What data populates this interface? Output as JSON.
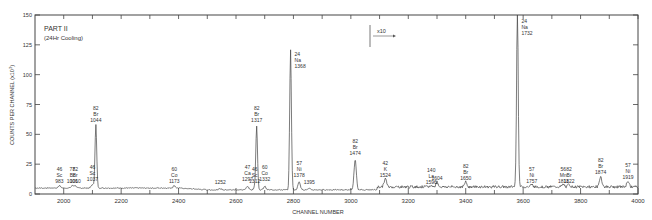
{
  "chart_data": {
    "type": "line",
    "title": "PART II",
    "subtitle": "(24Hr Cooling)",
    "xlabel": "CHANNEL NUMBER",
    "ylabel": "COUNTS PER CHANNEL (x10^3)",
    "xlim": [
      1900,
      4000
    ],
    "ylim": [
      0,
      150
    ],
    "x_ticks": [
      2000,
      2200,
      2400,
      2600,
      2800,
      3000,
      3200,
      3400,
      3600,
      3800,
      4000
    ],
    "y_ticks": [
      0,
      25,
      50,
      75,
      100,
      125,
      150
    ],
    "y_tick_labels": [
      "0",
      "25",
      "50",
      "75",
      "100",
      "125",
      "150"
    ],
    "grid": false,
    "scale_annotation": {
      "text": "x10",
      "x_start": 3290,
      "note": "data beyond this channel shown magnified x10"
    },
    "baseline_counts": 5,
    "peaks": [
      {
        "channel": 1985,
        "height": 7,
        "label": [
          "46",
          "Sc",
          "983"
        ]
      },
      {
        "channel": 2030,
        "height": 7,
        "label": [
          "77",
          "Br",
          "1006"
        ]
      },
      {
        "channel": 2040,
        "height": 7,
        "label": [
          "82",
          "Br",
          "1010"
        ]
      },
      {
        "channel": 2100,
        "height": 8,
        "label": [
          "46",
          "Sc",
          "1037"
        ]
      },
      {
        "channel": 2112,
        "height": 58,
        "label": [
          "82",
          "Br",
          "1044"
        ]
      },
      {
        "channel": 2385,
        "height": 7,
        "label": [
          "60",
          "Co",
          "1173"
        ]
      },
      {
        "channel": 2545,
        "height": 6,
        "label": [
          "1252"
        ]
      },
      {
        "channel": 2640,
        "height": 8,
        "label": [
          "47",
          "Ca",
          "1297"
        ]
      },
      {
        "channel": 2665,
        "height": 7,
        "label": [
          "46",
          "Sc",
          "1312"
        ]
      },
      {
        "channel": 2672,
        "height": 58,
        "label": [
          "82",
          "Br",
          "1317"
        ]
      },
      {
        "channel": 2700,
        "height": 8,
        "label": [
          "60",
          "Co",
          "1332"
        ]
      },
      {
        "channel": 2790,
        "height": 122,
        "label": [
          "24",
          "Na",
          "1368"
        ]
      },
      {
        "channel": 2820,
        "height": 12,
        "label": [
          "57",
          "Ni",
          "1378"
        ]
      },
      {
        "channel": 2855,
        "height": 6,
        "label": [
          "1395"
        ]
      },
      {
        "channel": 3015,
        "height": 30,
        "label": [
          "82",
          "Br",
          "1474"
        ]
      },
      {
        "channel": 3120,
        "height": 12,
        "label": [
          "42",
          "K",
          "1524"
        ]
      },
      {
        "channel": 3280,
        "height": 6,
        "label": [
          "140",
          "La",
          "1596"
        ]
      },
      {
        "channel": 3300,
        "height": 9,
        "label": [
          "1604"
        ]
      },
      {
        "channel": 3400,
        "height": 9,
        "label": [
          "82",
          "Br",
          "1650"
        ]
      },
      {
        "channel": 3580,
        "height": 150,
        "label": [
          "24",
          "Na",
          "1732"
        ]
      },
      {
        "channel": 3630,
        "height": 7,
        "label": [
          "57",
          "Ni",
          "1757"
        ]
      },
      {
        "channel": 3740,
        "height": 7,
        "label": [
          "56",
          "Mn",
          "1811"
        ]
      },
      {
        "channel": 3760,
        "height": 7,
        "label": [
          "82",
          "Br",
          "1822"
        ]
      },
      {
        "channel": 3870,
        "height": 14,
        "label": [
          "82",
          "Br",
          "1874"
        ]
      },
      {
        "channel": 3965,
        "height": 10,
        "label": [
          "57",
          "Ni",
          "1919"
        ]
      }
    ]
  },
  "labels": {
    "title": "PART II",
    "subtitle": "(24Hr Cooling)",
    "xlabel": "CHANNEL NUMBER",
    "ylabel": "COUNTS PER CHANNEL (x10",
    "ylabel_sup": "3",
    "ylabel_end": ")",
    "scale": "x10"
  }
}
